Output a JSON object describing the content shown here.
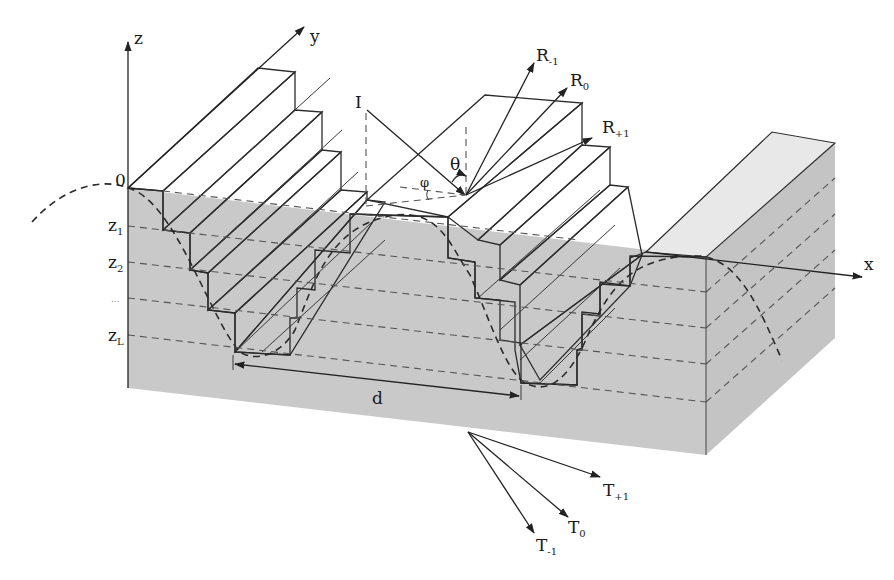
{
  "figure": {
    "type": "3D schematic of a staircase-approximated sinusoidal diffraction grating",
    "colors": {
      "background": "#ffffff",
      "front_face": "#c9c9c9",
      "side_face": "#c4c4c4",
      "top_face": "#e6e6e6",
      "riser_face": "#dcdcdc",
      "line": "#2b2b2b"
    }
  },
  "axes": {
    "z": "z",
    "y": "y",
    "x": "x",
    "origin": "0"
  },
  "layers": {
    "z1": {
      "base": "z",
      "sub": "1"
    },
    "z2": {
      "base": "z",
      "sub": "2"
    },
    "ellipsis": "...",
    "zL": {
      "base": "z",
      "sub": "L"
    }
  },
  "incident": {
    "label": "I",
    "polar_angle": "θ",
    "azimuth_angle": "φ"
  },
  "reflected_orders": [
    {
      "base": "R",
      "sub": "-1"
    },
    {
      "base": "R",
      "sub": "0"
    },
    {
      "base": "R",
      "sub": "+1"
    }
  ],
  "transmitted_orders": [
    {
      "base": "T",
      "sub": "+1"
    },
    {
      "base": "T",
      "sub": "0"
    },
    {
      "base": "T",
      "sub": "-1"
    }
  ],
  "period": {
    "label": "d"
  }
}
